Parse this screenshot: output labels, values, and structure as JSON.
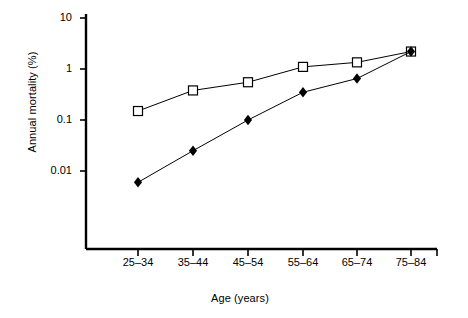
{
  "chart_data": {
    "type": "line",
    "title": "",
    "xlabel": "Age (years)",
    "ylabel": "Annual mortality (%)",
    "categories": [
      "25–34",
      "35–44",
      "45–54",
      "55–64",
      "65–74",
      "75–84"
    ],
    "yscale": "log",
    "ylim": [
      0.004,
      10
    ],
    "yticks": [
      10,
      1,
      0.1,
      0.01
    ],
    "ytick_labels": [
      "10",
      "1",
      "0.1",
      "0.01"
    ],
    "grid": false,
    "legend": "none",
    "series": [
      {
        "name": "open-square-series",
        "marker": "open-square",
        "color": "#000000",
        "values": [
          0.15,
          0.38,
          0.55,
          1.1,
          1.35,
          2.2
        ]
      },
      {
        "name": "filled-diamond-series",
        "marker": "filled-diamond",
        "color": "#000000",
        "values": [
          0.006,
          0.025,
          0.1,
          0.35,
          0.65,
          2.2
        ]
      }
    ]
  },
  "axes": {
    "x_axis_name": "age-axis",
    "y_axis_name": "mortality-axis"
  }
}
